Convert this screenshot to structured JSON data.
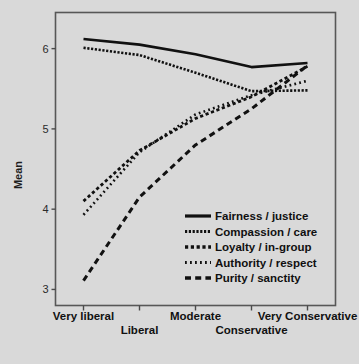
{
  "chart_data": {
    "type": "line",
    "title": "",
    "xlabel": "",
    "ylabel": "Mean",
    "categories": [
      "Very liberal",
      "Liberal",
      "Moderate",
      "Conservative",
      "Very Conservative"
    ],
    "x_tick_labels": [
      "Very liberal",
      "Liberal",
      "Moderate",
      "Conservative",
      "Very Conservative"
    ],
    "y_tick_labels": [
      "3",
      "4",
      "5",
      "6"
    ],
    "y_ticks": [
      3,
      4,
      5,
      6
    ],
    "ylim": [
      2.8,
      6.45
    ],
    "grid": false,
    "legend_position": "inside-lower-right",
    "series": [
      {
        "name": "Fairness / justice",
        "dash": "solid",
        "values": [
          6.12,
          6.05,
          5.93,
          5.77,
          5.82
        ]
      },
      {
        "name": "Compassion / care",
        "dash": "fine-dotted",
        "values": [
          6.01,
          5.92,
          5.7,
          5.47,
          5.48
        ]
      },
      {
        "name": "Loyalty / in-group",
        "dash": "square-dotted",
        "values": [
          4.1,
          4.73,
          5.13,
          5.4,
          5.78
        ]
      },
      {
        "name": "Authority / respect",
        "dash": "round-dotted",
        "values": [
          3.93,
          4.71,
          5.18,
          5.42,
          5.6
        ]
      },
      {
        "name": "Purity / sanctity",
        "dash": "dashed",
        "values": [
          3.11,
          4.15,
          4.8,
          5.25,
          5.79
        ]
      }
    ]
  },
  "legend": {
    "items": [
      {
        "label": "Fairness / justice"
      },
      {
        "label": "Compassion / care"
      },
      {
        "label": "Loyalty / in-group"
      },
      {
        "label": "Authority / respect"
      },
      {
        "label": "Purity / sanctity"
      }
    ]
  },
  "colors": {
    "background": "#d9d9d9",
    "frame": "#575757",
    "ink": "#111111"
  }
}
